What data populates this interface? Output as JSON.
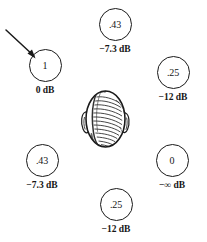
{
  "figure": {
    "center_icon": "head-top-view-icon",
    "pointer_icon": "arrow-icon"
  },
  "nodes": [
    {
      "id": "top",
      "name": "speaker-node-top",
      "gain": ".43",
      "db": "−7.3 dB"
    },
    {
      "id": "left-upper",
      "name": "speaker-node-left-upper",
      "gain": "1",
      "db": "0 dB"
    },
    {
      "id": "right-upper",
      "name": "speaker-node-right-upper",
      "gain": ".25",
      "db": "−12 dB"
    },
    {
      "id": "left-lower",
      "name": "speaker-node-left-lower",
      "gain": ".43",
      "db": "−7.3 dB"
    },
    {
      "id": "right-lower",
      "name": "speaker-node-right-lower",
      "gain": "0",
      "db": "−∞ dB"
    },
    {
      "id": "bottom",
      "name": "speaker-node-bottom",
      "gain": ".25",
      "db": "−12 dB"
    }
  ],
  "colors": {
    "ink": "#1a1a1a",
    "background": "#ffffff"
  }
}
